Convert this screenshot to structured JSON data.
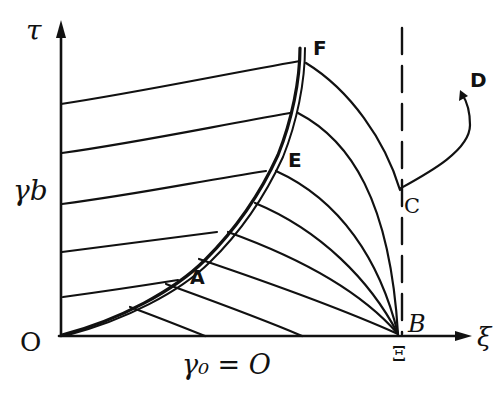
{
  "diagram": {
    "axes": {
      "vertical_label": "τ",
      "horizontal_label": "ξ",
      "origin_label": "O",
      "vertical_marker_label": "γb",
      "horizontal_marker_label": "Ξ",
      "bottom_label": "γ₀ = O"
    },
    "points": {
      "A": "A",
      "B": "B",
      "C": "C",
      "D": "D",
      "E": "E",
      "F": "F"
    },
    "colors": {
      "ink": "#111111",
      "background": "#ffffff"
    }
  }
}
